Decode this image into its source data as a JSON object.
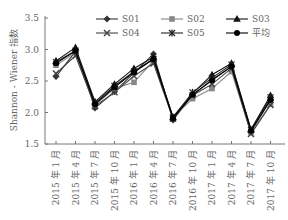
{
  "chart_data": {
    "type": "line",
    "title": "",
    "xlabel": "",
    "ylabel": "Shannon - Wiener 指数",
    "ylim": [
      1.5,
      3.5
    ],
    "yticks": [
      "1.5",
      "2.0",
      "2.5",
      "3.0",
      "3.5"
    ],
    "grid": false,
    "legend_position": "top-right",
    "categories": [
      "2015 年 1 月",
      "2015 年 4 月",
      "2015 年 7 月",
      "2015 年 10 月",
      "2016 年 1 月",
      "2016 年 4 月",
      "2016 年 7 月",
      "2016 年 10 月",
      "2017 年 1 月",
      "2017 年 4 月",
      "2017 年 7 月",
      "2017 年 10 月"
    ],
    "series": [
      {
        "name": "S01",
        "marker": "diamond",
        "color": "#333333",
        "values": [
          2.57,
          2.97,
          2.07,
          2.33,
          2.63,
          2.93,
          1.88,
          2.28,
          2.52,
          2.73,
          1.7,
          2.2
        ]
      },
      {
        "name": "S02",
        "marker": "square",
        "color": "#888888",
        "values": [
          2.75,
          2.95,
          2.12,
          2.38,
          2.48,
          2.82,
          1.92,
          2.22,
          2.38,
          2.65,
          1.68,
          2.13
        ]
      },
      {
        "name": "S03",
        "marker": "triangle",
        "color": "#111111",
        "values": [
          2.82,
          3.03,
          2.17,
          2.45,
          2.7,
          2.88,
          1.93,
          2.3,
          2.6,
          2.78,
          1.73,
          2.27
        ]
      },
      {
        "name": "S04",
        "marker": "x",
        "color": "#444444",
        "values": [
          2.62,
          2.9,
          2.1,
          2.32,
          2.58,
          2.78,
          1.9,
          2.27,
          2.45,
          2.7,
          1.66,
          2.12
        ]
      },
      {
        "name": "S05",
        "marker": "star",
        "color": "#222222",
        "values": [
          2.8,
          2.98,
          2.15,
          2.42,
          2.65,
          2.85,
          1.92,
          2.32,
          2.55,
          2.76,
          1.72,
          2.24
        ]
      },
      {
        "name": "平均",
        "marker": "circle",
        "color": "#000000",
        "values": [
          2.78,
          2.98,
          2.13,
          2.4,
          2.64,
          2.85,
          1.91,
          2.28,
          2.51,
          2.73,
          1.71,
          2.2
        ]
      }
    ]
  }
}
